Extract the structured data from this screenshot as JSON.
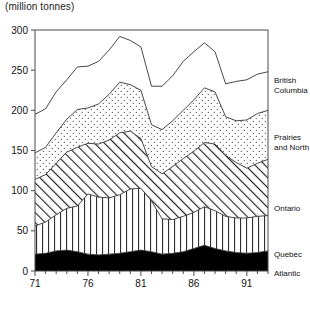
{
  "title": "(million tonnes)",
  "axes": {
    "y_ticks": [
      "0",
      "50",
      "100",
      "150",
      "200",
      "250",
      "300"
    ],
    "x_ticks": [
      "71",
      "76",
      "81",
      "86",
      "91"
    ]
  },
  "legend": {
    "british_columbia_line1": "British",
    "british_columbia_line2": "Columbia",
    "prairies_line1": "Prairies",
    "prairies_line2": "and North",
    "ontario": "Ontario",
    "quebec": "Quebec",
    "atlantic": "Atlantic"
  },
  "chart_data": {
    "type": "area",
    "title": "(million tonnes)",
    "xlabel": "",
    "ylabel": "million tonnes",
    "ylim": [
      0,
      300
    ],
    "xlim": [
      1971,
      1993
    ],
    "grid": false,
    "stacked": true,
    "legend_position": "right-outside",
    "x": [
      1971,
      1972,
      1973,
      1974,
      1975,
      1976,
      1977,
      1978,
      1979,
      1980,
      1981,
      1982,
      1983,
      1984,
      1985,
      1986,
      1987,
      1988,
      1989,
      1990,
      1991,
      1992,
      1993
    ],
    "tick_years": [
      1971,
      1976,
      1981,
      1986,
      1991
    ],
    "series": [
      {
        "name": "Atlantic",
        "fill": "black",
        "values": [
          21,
          22,
          25,
          26,
          24,
          21,
          20,
          21,
          22,
          24,
          26,
          24,
          21,
          22,
          24,
          28,
          32,
          28,
          25,
          23,
          22,
          23,
          25
        ]
      },
      {
        "name": "Quebec",
        "fill": "vertical-hatch",
        "values": [
          35,
          39,
          45,
          52,
          57,
          75,
          72,
          70,
          73,
          78,
          77,
          63,
          44,
          42,
          44,
          45,
          48,
          47,
          43,
          43,
          44,
          45,
          44
        ]
      },
      {
        "name": "Ontario",
        "fill": "diagonal-hatch",
        "values": [
          58,
          59,
          64,
          70,
          73,
          63,
          66,
          72,
          77,
          72,
          62,
          43,
          56,
          66,
          72,
          76,
          80,
          83,
          76,
          69,
          62,
          66,
          70
        ]
      },
      {
        "name": "Prairies and North",
        "fill": "dotted",
        "values": [
          33,
          34,
          38,
          41,
          47,
          44,
          50,
          57,
          63,
          58,
          60,
          52,
          55,
          57,
          60,
          64,
          68,
          65,
          48,
          52,
          60,
          62,
          61
        ]
      },
      {
        "name": "British Columbia",
        "fill": "white",
        "values": [
          48,
          48,
          51,
          49,
          53,
          52,
          53,
          55,
          57,
          55,
          54,
          48,
          54,
          56,
          61,
          60,
          56,
          50,
          41,
          49,
          50,
          49,
          48
        ]
      }
    ],
    "totals": [
      195,
      202,
      223,
      238,
      254,
      255,
      261,
      275,
      292,
      287,
      279,
      230,
      230,
      243,
      261,
      273,
      284,
      273,
      233,
      236,
      238,
      245,
      248
    ]
  }
}
